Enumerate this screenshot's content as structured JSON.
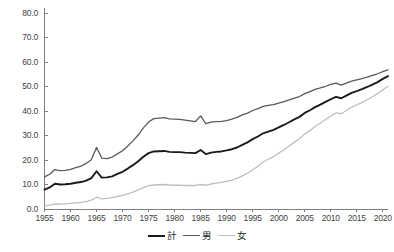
{
  "chart_data": {
    "type": "line",
    "title": "",
    "subtitle": "",
    "xlabel": "",
    "ylabel": "",
    "xlim": [
      1955,
      2021
    ],
    "ylim": [
      0.0,
      80.0
    ],
    "grid": false,
    "legend_position": "bottom-center",
    "y_ticks": [
      "0.0",
      "10.0",
      "20.0",
      "30.0",
      "40.0",
      "50.0",
      "60.0",
      "70.0",
      "80.0"
    ],
    "y_tick_values": [
      0.0,
      10.0,
      20.0,
      30.0,
      40.0,
      50.0,
      60.0,
      70.0,
      80.0
    ],
    "x_ticks": [
      "1955",
      "1960",
      "1965",
      "1970",
      "1975",
      "1980",
      "1985",
      "1990",
      "1995",
      "2000",
      "2005",
      "2010",
      "2015",
      "2020"
    ],
    "x_tick_values": [
      1955,
      1960,
      1965,
      1970,
      1975,
      1980,
      1985,
      1990,
      1995,
      2000,
      2005,
      2010,
      2015,
      2020
    ],
    "x": [
      1955,
      1956,
      1957,
      1958,
      1959,
      1960,
      1961,
      1962,
      1963,
      1964,
      1965,
      1966,
      1967,
      1968,
      1969,
      1970,
      1971,
      1972,
      1973,
      1974,
      1975,
      1976,
      1977,
      1978,
      1979,
      1980,
      1981,
      1982,
      1983,
      1984,
      1985,
      1986,
      1987,
      1988,
      1989,
      1990,
      1991,
      1992,
      1993,
      1994,
      1995,
      1996,
      1997,
      1998,
      1999,
      2000,
      2001,
      2002,
      2003,
      2004,
      2005,
      2006,
      2007,
      2008,
      2009,
      2010,
      2011,
      2012,
      2013,
      2014,
      2015,
      2016,
      2017,
      2018,
      2019,
      2020,
      2021
    ],
    "series": [
      {
        "name": "計",
        "color": "#1a1a1a",
        "width": 1.9,
        "values": [
          7.9,
          8.8,
          10.3,
          10.0,
          10.1,
          10.3,
          10.7,
          11.0,
          11.6,
          12.6,
          15.4,
          12.8,
          12.9,
          13.3,
          14.3,
          15.2,
          16.5,
          17.9,
          19.5,
          21.3,
          22.8,
          23.5,
          23.6,
          23.7,
          23.3,
          23.2,
          23.2,
          23.0,
          22.9,
          22.8,
          24.1,
          22.4,
          23.0,
          23.3,
          23.5,
          23.9,
          24.4,
          25.1,
          26.2,
          27.2,
          28.5,
          29.6,
          30.9,
          31.6,
          32.3,
          33.3,
          34.3,
          35.4,
          36.6,
          37.6,
          39.2,
          40.3,
          41.6,
          42.6,
          43.7,
          44.8,
          45.8,
          45.2,
          46.3,
          47.4,
          48.1,
          48.9,
          49.8,
          50.8,
          51.8,
          53.1,
          54.2
        ]
      },
      {
        "name": "男",
        "color": "#595959",
        "width": 1.3,
        "values": [
          13.1,
          14.2,
          16.1,
          15.7,
          15.8,
          16.2,
          16.9,
          17.5,
          18.6,
          20.1,
          25.1,
          20.8,
          20.6,
          21.2,
          22.5,
          23.8,
          25.7,
          27.8,
          30.2,
          33.1,
          35.5,
          36.9,
          37.1,
          37.3,
          36.8,
          36.7,
          36.6,
          36.3,
          36.0,
          35.7,
          38.0,
          34.8,
          35.5,
          35.7,
          35.8,
          36.1,
          36.7,
          37.4,
          38.4,
          39.1,
          40.2,
          41.0,
          41.9,
          42.3,
          42.6,
          43.2,
          43.8,
          44.5,
          45.3,
          45.9,
          47.1,
          47.9,
          48.8,
          49.4,
          50.1,
          50.9,
          51.4,
          50.6,
          51.4,
          52.2,
          52.7,
          53.2,
          53.8,
          54.5,
          55.2,
          56.1,
          56.8
        ]
      },
      {
        "name": "女",
        "color": "#bfbfbf",
        "width": 1.3,
        "values": [
          1.3,
          1.6,
          2.1,
          2.0,
          2.1,
          2.3,
          2.5,
          2.7,
          3.0,
          3.6,
          4.8,
          4.1,
          4.3,
          4.6,
          5.1,
          5.6,
          6.2,
          6.9,
          7.8,
          8.7,
          9.5,
          9.8,
          9.9,
          10.0,
          9.8,
          9.7,
          9.7,
          9.6,
          9.6,
          9.6,
          10.0,
          9.7,
          10.2,
          10.6,
          10.9,
          11.3,
          11.8,
          12.5,
          13.5,
          14.6,
          16.0,
          17.4,
          19.2,
          20.3,
          21.4,
          22.8,
          24.2,
          25.7,
          27.3,
          28.7,
          30.6,
          32.0,
          33.7,
          35.0,
          36.5,
          37.9,
          39.2,
          38.9,
          40.2,
          41.6,
          42.5,
          43.5,
          44.6,
          45.8,
          47.1,
          48.7,
          50.1
        ]
      }
    ]
  },
  "legend": {
    "items": [
      {
        "label": "計",
        "color": "#1a1a1a"
      },
      {
        "label": "男",
        "color": "#595959"
      },
      {
        "label": "女",
        "color": "#bfbfbf"
      }
    ]
  },
  "axes": {
    "axis_color": "#808080",
    "tick_color": "#808080",
    "label_color": "#3f3f3f"
  }
}
